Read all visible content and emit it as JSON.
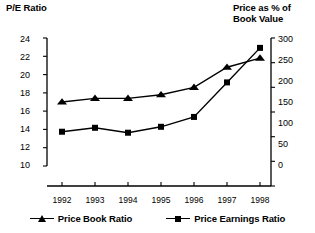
{
  "chart_data": {
    "type": "line",
    "title": "",
    "categories": [
      "1992",
      "1993",
      "1994",
      "1995",
      "1996",
      "1997",
      "1998"
    ],
    "xlabel": "",
    "series": [
      {
        "name": "Price Book Ratio",
        "marker": "triangle",
        "axis": "left",
        "values": [
          17.0,
          17.4,
          17.4,
          17.8,
          18.6,
          20.8,
          21.8
        ]
      },
      {
        "name": "Price Earnings Ratio",
        "marker": "square",
        "axis": "right",
        "values": [
          110,
          118,
          108,
          120,
          140,
          210,
          280
        ]
      }
    ],
    "left_axis": {
      "label": "P/E Ratio",
      "ticks": [
        10,
        12,
        14,
        16,
        18,
        20,
        22,
        24
      ],
      "ylim": [
        10,
        24
      ]
    },
    "right_axis": {
      "label": "Price as % of\nBook Value",
      "ticks": [
        0,
        50,
        100,
        150,
        200,
        250,
        300
      ],
      "ylim": [
        0,
        300
      ]
    },
    "grid": false,
    "legend_position": "bottom"
  },
  "left_axis_title": "P/E Ratio",
  "right_axis_title": "Price as % of\nBook Value",
  "left_ticks": [
    "24",
    "22",
    "20",
    "18",
    "16",
    "14",
    "12",
    "10"
  ],
  "right_ticks": [
    "300",
    "250",
    "200",
    "150",
    "100",
    "50",
    "0"
  ],
  "x_ticks": [
    "1992",
    "1993",
    "1994",
    "1995",
    "1996",
    "1997",
    "1998"
  ],
  "legend": [
    {
      "label": "Price Book Ratio",
      "marker": "triangle-marker-icon"
    },
    {
      "label": "Price Earnings Ratio",
      "marker": "square-marker-icon"
    }
  ]
}
